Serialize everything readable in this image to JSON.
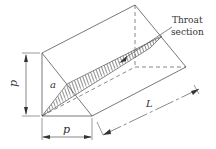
{
  "figure": {
    "type": "isometric triangular prism (fillet weld) with throat section",
    "labels": {
      "throat": "Throat",
      "section": "section",
      "height": "p",
      "base": "p",
      "angle": "a",
      "length": "L"
    },
    "colors": {
      "line": "#555555",
      "hatch": "#555555",
      "background": "#ffffff"
    }
  }
}
